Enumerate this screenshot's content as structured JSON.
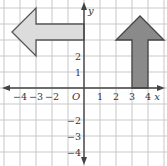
{
  "diagram": {
    "type": "coordinate-grid",
    "grid": {
      "x_range": [
        -5,
        5
      ],
      "y_range": [
        -5,
        5
      ],
      "cell_px": 16,
      "origin_px": [
        84,
        88
      ],
      "grid_color": "#c9c9c9",
      "axis_color": "#444444"
    },
    "axes": {
      "x_label": "x",
      "y_label": "y",
      "origin_label": "O",
      "x_ticks": [
        {
          "value": -4,
          "label": "−4"
        },
        {
          "value": -3,
          "label": "−3"
        },
        {
          "value": -2,
          "label": "−2"
        },
        {
          "value": 1,
          "label": "1"
        },
        {
          "value": 2,
          "label": "2"
        },
        {
          "value": 3,
          "label": "3"
        },
        {
          "value": 4,
          "label": "4"
        }
      ],
      "y_ticks": [
        {
          "value": 2,
          "label": "2"
        },
        {
          "value": 1,
          "label": "1"
        },
        {
          "value": -2,
          "label": "−2"
        },
        {
          "value": -3,
          "label": "−3"
        },
        {
          "value": -4,
          "label": "−4"
        }
      ]
    },
    "shapes": [
      {
        "name": "left-pointing-arrow",
        "fill": "#dcdcdc",
        "stroke": "#555555",
        "vertices": [
          [
            0,
            4
          ],
          [
            -3,
            4
          ],
          [
            -3,
            5
          ],
          [
            -4.5,
            3.5
          ],
          [
            -3,
            2
          ],
          [
            -3,
            3
          ],
          [
            0,
            3
          ]
        ]
      },
      {
        "name": "up-pointing-arrow",
        "fill": "#8a8a8a",
        "stroke": "#444444",
        "vertices": [
          [
            3,
            0
          ],
          [
            3,
            3
          ],
          [
            2,
            3
          ],
          [
            3.5,
            4.5
          ],
          [
            5,
            3
          ],
          [
            4,
            3
          ],
          [
            4,
            0
          ]
        ]
      }
    ]
  }
}
